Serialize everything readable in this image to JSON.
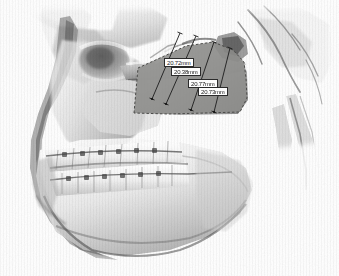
{
  "viewport": {
    "width": 339,
    "height": 276,
    "background_color": "#ffffff",
    "modality_label": "3D volume rendering, lateral skull view"
  },
  "render": {
    "name": "cbct-skull-volume-render",
    "description": "Grayscale 3D reconstructed lateral view of skull, maxilla and mandible with dentition and orthodontic brackets",
    "bone_light": "#f2f1ef",
    "bone_mid": "#c9c7c4",
    "bone_shadow": "#6f6d6b",
    "bone_dark": "#3a3937",
    "background_color": "#ffffff"
  },
  "highlight_region": {
    "name": "mandibular-ramus-overlay",
    "label": "Shaded mandibular ramus region of interest",
    "fill_color": "#8d8d8a",
    "fill_opacity": 0.86,
    "border_color": "#4a4a48",
    "border_style": "dashed",
    "points": "134,113 138,68 160,58 186,46 213,42 233,50 244,62 246,78 247,98 240,112 205,113 168,114"
  },
  "measurements": {
    "unit": "mm",
    "label_text_color": "#1a1a1a",
    "label_box_color": "#fdfdfd",
    "label_border_color": "#2b2b2b",
    "line_color": "#1c1c1c",
    "items": [
      {
        "id": "ramus-height-1",
        "name": "measurement-line-1",
        "value": "20.72mm",
        "label_x": 164,
        "label_y": 58,
        "x1": 180,
        "y1": 33,
        "x2": 152,
        "y2": 99,
        "tick_len": 5
      },
      {
        "id": "ramus-height-2",
        "name": "measurement-line-2",
        "value": "20.38mm",
        "label_x": 171,
        "label_y": 67,
        "x1": 196,
        "y1": 36,
        "x2": 166,
        "y2": 104,
        "tick_len": 5
      },
      {
        "id": "ramus-height-3",
        "name": "measurement-line-3",
        "value": "20.77mm",
        "label_x": 188,
        "label_y": 79,
        "x1": 214,
        "y1": 42,
        "x2": 191,
        "y2": 110,
        "tick_len": 5
      },
      {
        "id": "ramus-height-4",
        "name": "measurement-line-4",
        "value": "20.73mm",
        "label_x": 198,
        "label_y": 87,
        "x1": 230,
        "y1": 48,
        "x2": 214,
        "y2": 112,
        "tick_len": 5
      }
    ]
  },
  "anatomy_notes": {
    "condyle": "mandibular condyle, upper right of shaded region",
    "coronoid": "coronoid process, upper left of shaded region",
    "dentition": "maxillary and mandibular arches with bonded orthodontic brackets and archwire",
    "gonial_angle": "lower right of shaded region"
  }
}
